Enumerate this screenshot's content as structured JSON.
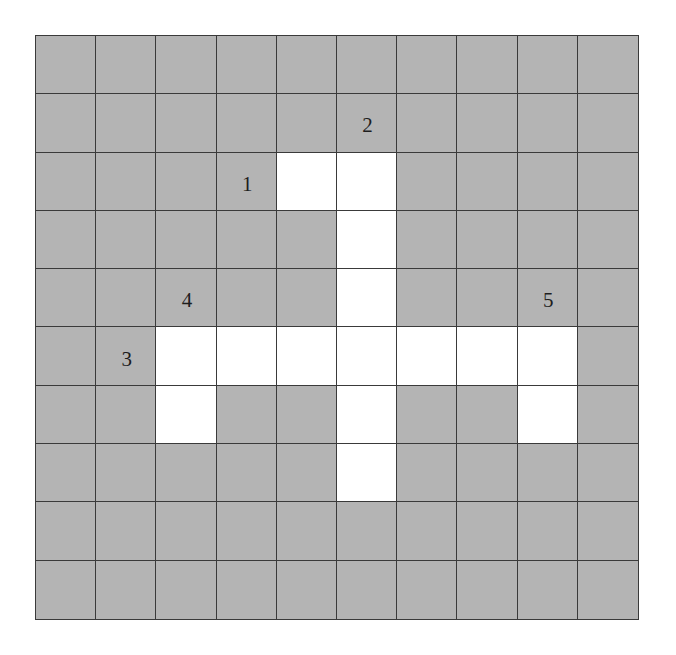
{
  "puzzle": {
    "type": "crossword-grid",
    "rows": 10,
    "cols": 10,
    "colors": {
      "blocked": "#b4b4b4",
      "open": "#ffffff",
      "gridline": "#3a3a3a",
      "number": "#1e1e1e"
    },
    "open_cells": [
      [
        2,
        4
      ],
      [
        2,
        5
      ],
      [
        3,
        5
      ],
      [
        4,
        5
      ],
      [
        5,
        2
      ],
      [
        5,
        3
      ],
      [
        5,
        4
      ],
      [
        5,
        5
      ],
      [
        5,
        6
      ],
      [
        5,
        7
      ],
      [
        5,
        8
      ],
      [
        6,
        2
      ],
      [
        6,
        5
      ],
      [
        6,
        8
      ],
      [
        7,
        5
      ]
    ],
    "clue_numbers": [
      {
        "label": "1",
        "row": 2,
        "col": 3
      },
      {
        "label": "2",
        "row": 1,
        "col": 5
      },
      {
        "label": "3",
        "row": 5,
        "col": 1
      },
      {
        "label": "4",
        "row": 4,
        "col": 2
      },
      {
        "label": "5",
        "row": 4,
        "col": 8
      }
    ]
  }
}
